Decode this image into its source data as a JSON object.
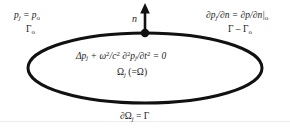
{
  "figure": {
    "background_color": "#ffffff",
    "ink_color": "#111111",
    "divider_color": "#ececec"
  },
  "labels": {
    "dirichlet_condition": "p",
    "dirichlet_condition_sub": "j",
    "dirichlet_condition_rest": " = p",
    "dirichlet_condition_sub2": "o",
    "dirichlet_boundary": "Γ",
    "dirichlet_boundary_sub": "o",
    "neumann_condition": "∂p",
    "neumann_condition_sub": "j",
    "neumann_condition_mid": "/∂n = ∂p/∂n|",
    "neumann_condition_sub2": "o",
    "neumann_boundary": "Γ – Γ",
    "neumann_boundary_sub": "o",
    "normal_vector": "n",
    "helmholtz_lhs": "Δp",
    "helmholtz_sub1": "j",
    "helmholtz_mid": " + ω",
    "helmholtz_sup1": "2",
    "helmholtz_mid2": "/c",
    "helmholtz_sup2": "2",
    "helmholtz_mid3": " ∂",
    "helmholtz_sup3": "2",
    "helmholtz_mid4": "p",
    "helmholtz_sub2": "j",
    "helmholtz_mid5": "/∂t",
    "helmholtz_sup4": "2",
    "helmholtz_end": " = 0",
    "domain_symbol": "Ω",
    "domain_sub": "j",
    "domain_equals": " (=Ω)",
    "boundary_symbol": "∂Ω",
    "boundary_sub": "j",
    "boundary_equals": " = Γ"
  },
  "geometry": {
    "ellipse_center_x": 145,
    "ellipse_center_y": 68,
    "ellipse_radius_x": 117,
    "ellipse_radius_y": 35,
    "ellipse_stroke_width": 3,
    "normal_point_x": 145,
    "normal_point_y": 33,
    "normal_arrow_tip_y": 4,
    "normal_dot_radius": 4
  }
}
